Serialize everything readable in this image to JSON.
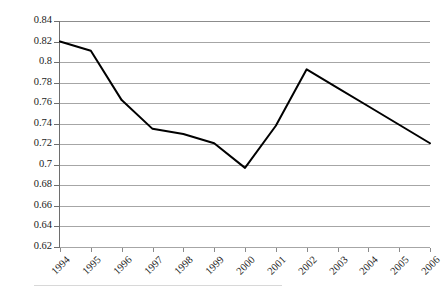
{
  "chart_data": {
    "type": "line",
    "title": "",
    "subtitle": "",
    "xlabel": "",
    "ylabel": "",
    "categories": [
      "1994",
      "1995",
      "1996",
      "1997",
      "1998",
      "1999",
      "2000",
      "2001",
      "2002",
      "2003",
      "2004",
      "2005",
      "2006"
    ],
    "x": [
      1994,
      1995,
      1996,
      1997,
      1998,
      1999,
      2000,
      2001,
      2002,
      2003,
      2004,
      2005,
      2006
    ],
    "values": [
      0.82,
      0.811,
      0.763,
      0.735,
      0.73,
      0.721,
      0.697,
      0.738,
      0.793,
      0.775,
      0.757,
      0.739,
      0.721
    ],
    "series": [
      {
        "name": "series-1",
        "values": [
          0.82,
          0.811,
          0.763,
          0.735,
          0.73,
          0.721,
          0.697,
          0.738,
          0.793,
          0.775,
          0.757,
          0.739,
          0.721
        ],
        "color": "#000000",
        "line_width": 2,
        "markers": false
      }
    ],
    "ylim": [
      0.62,
      0.84
    ],
    "ytick_step": 0.02,
    "yticks": [
      0.84,
      0.82,
      0.8,
      0.78,
      0.76,
      0.74,
      0.72,
      0.7,
      0.68,
      0.66,
      0.64,
      0.62
    ],
    "ytick_labels": [
      "0.84",
      "0.82",
      "0.8",
      "0.78",
      "0.76",
      "0.74",
      "0.72",
      "0.7",
      "0.68",
      "0.66",
      "0.64",
      "0.62"
    ],
    "grid": true,
    "grid_axis": "y",
    "grid_color": "#a6a6a6",
    "legend": false,
    "legend_position": "none",
    "xtick_label_rotation": -45,
    "annotations": []
  },
  "colors": {
    "background": "#ffffff",
    "series_line": "#000000",
    "gridline": "#a6a6a6",
    "axis_line": "#6e6e6e",
    "tick_text": "#1a1a1a"
  }
}
